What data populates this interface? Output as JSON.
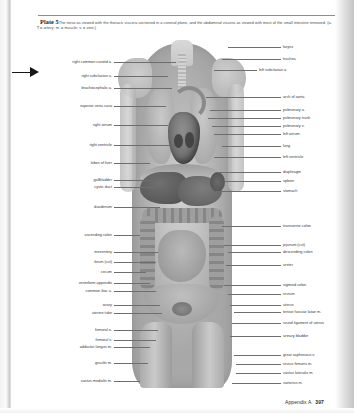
{
  "page": {
    "plate_number": "Plate 5",
    "caption": "The torso as viewed with the thoracic viscera sectioned in a coronal plane, and the abdominal viscera as viewed with most of the small intestine removed. (a. = artery; m. = muscle; v. = vein.)",
    "caption_marker": "¶",
    "footer_section": "Appendix A",
    "footer_page": "397"
  },
  "figure": {
    "alt": "grayscale anatomical illustration of female torso with thoracic and abdominal viscera"
  },
  "labels_left": [
    {
      "text": "right common carotid a.",
      "top": 62,
      "text_right": 112,
      "line_from": 114,
      "line_to": 176,
      "line_y": 62
    },
    {
      "text": "right subclavian a.",
      "top": 76,
      "text_right": 112,
      "line_from": 114,
      "line_to": 168,
      "line_y": 76
    },
    {
      "text": "brachiocephalic a.",
      "top": 88,
      "text_right": 112,
      "line_from": 114,
      "line_to": 172,
      "line_y": 88
    },
    {
      "text": "superior vena cava",
      "top": 106,
      "text_right": 112,
      "line_from": 114,
      "line_to": 166,
      "line_y": 106
    },
    {
      "text": "right atrium",
      "top": 125,
      "text_right": 112,
      "line_from": 114,
      "line_to": 168,
      "line_y": 125
    },
    {
      "text": "right ventricle",
      "top": 145,
      "text_right": 112,
      "line_from": 114,
      "line_to": 170,
      "line_y": 145
    },
    {
      "text": "lobes of liver",
      "top": 163,
      "text_right": 112,
      "line_from": 114,
      "line_to": 150,
      "line_y": 163
    },
    {
      "text": "gallbladder",
      "top": 180,
      "text_right": 112,
      "line_from": 114,
      "line_to": 152,
      "line_y": 180
    },
    {
      "text": "cystic duct",
      "top": 187,
      "text_right": 112,
      "line_from": 114,
      "line_to": 156,
      "line_y": 187
    },
    {
      "text": "duodenum",
      "top": 207,
      "text_right": 112,
      "line_from": 114,
      "line_to": 160,
      "line_y": 207
    },
    {
      "text": "ascending colon",
      "top": 235,
      "text_right": 112,
      "line_from": 114,
      "line_to": 140,
      "line_y": 235
    },
    {
      "text": "mesentery",
      "top": 252,
      "text_right": 112,
      "line_from": 114,
      "line_to": 158,
      "line_y": 252
    },
    {
      "text": "ileum (cut)",
      "top": 262,
      "text_right": 112,
      "line_from": 114,
      "line_to": 156,
      "line_y": 262
    },
    {
      "text": "cecum",
      "top": 272,
      "text_right": 112,
      "line_from": 114,
      "line_to": 146,
      "line_y": 272
    },
    {
      "text": "vermiform appendix",
      "top": 283,
      "text_right": 112,
      "line_from": 114,
      "line_to": 150,
      "line_y": 283
    },
    {
      "text": "common iliac a.",
      "top": 291,
      "text_right": 112,
      "line_from": 114,
      "line_to": 156,
      "line_y": 291
    },
    {
      "text": "ovary",
      "top": 305,
      "text_right": 112,
      "line_from": 114,
      "line_to": 160,
      "line_y": 305
    },
    {
      "text": "uterine tube",
      "top": 313,
      "text_right": 112,
      "line_from": 114,
      "line_to": 162,
      "line_y": 313
    },
    {
      "text": "femoral a.",
      "top": 330,
      "text_right": 112,
      "line_from": 114,
      "line_to": 158,
      "line_y": 330
    },
    {
      "text": "femoral v.",
      "top": 340,
      "text_right": 112,
      "line_from": 114,
      "line_to": 156,
      "line_y": 340
    },
    {
      "text": "adductor longus m.",
      "top": 347,
      "text_right": 112,
      "line_from": 114,
      "line_to": 150,
      "line_y": 347
    },
    {
      "text": "gracilis m.",
      "top": 363,
      "text_right": 112,
      "line_from": 114,
      "line_to": 148,
      "line_y": 363
    },
    {
      "text": "vastus medialis m.",
      "top": 381,
      "text_right": 112,
      "line_from": 114,
      "line_to": 140,
      "line_y": 381
    }
  ],
  "labels_right": [
    {
      "text": "larynx",
      "top": 47,
      "text_left": 283,
      "line_from": 228,
      "line_to": 281,
      "line_y": 47
    },
    {
      "text": "trachea",
      "top": 59,
      "text_left": 283,
      "line_from": 222,
      "line_to": 281,
      "line_y": 59
    },
    {
      "text": "left subclavian a.",
      "top": 70,
      "text_left": 259,
      "line_from": 214,
      "line_to": 257,
      "line_y": 70
    },
    {
      "text": "arch of aorta",
      "top": 97,
      "text_left": 283,
      "line_from": 206,
      "line_to": 281,
      "line_y": 97
    },
    {
      "text": "pulmonary a.",
      "top": 110,
      "text_left": 283,
      "line_from": 210,
      "line_to": 281,
      "line_y": 110
    },
    {
      "text": "pulmonary trunk",
      "top": 118,
      "text_left": 283,
      "line_from": 208,
      "line_to": 281,
      "line_y": 118
    },
    {
      "text": "pulmonary v.",
      "top": 126,
      "text_left": 283,
      "line_from": 212,
      "line_to": 281,
      "line_y": 126
    },
    {
      "text": "left atrium",
      "top": 134,
      "text_left": 283,
      "line_from": 214,
      "line_to": 281,
      "line_y": 134
    },
    {
      "text": "lung",
      "top": 146,
      "text_left": 283,
      "line_from": 222,
      "line_to": 281,
      "line_y": 146
    },
    {
      "text": "left ventricle",
      "top": 157,
      "text_left": 283,
      "line_from": 214,
      "line_to": 281,
      "line_y": 157
    },
    {
      "text": "diaphragm",
      "top": 172,
      "text_left": 283,
      "line_from": 218,
      "line_to": 281,
      "line_y": 172
    },
    {
      "text": "spleen",
      "top": 181,
      "text_left": 283,
      "line_from": 224,
      "line_to": 281,
      "line_y": 181
    },
    {
      "text": "stomach",
      "top": 191,
      "text_left": 283,
      "line_from": 216,
      "line_to": 281,
      "line_y": 191
    },
    {
      "text": "transverse colon",
      "top": 226,
      "text_left": 283,
      "line_from": 222,
      "line_to": 281,
      "line_y": 226
    },
    {
      "text": "jejunum (cut)",
      "top": 245,
      "text_left": 283,
      "line_from": 224,
      "line_to": 281,
      "line_y": 245
    },
    {
      "text": "descending colon",
      "top": 252,
      "text_left": 283,
      "line_from": 228,
      "line_to": 281,
      "line_y": 252
    },
    {
      "text": "ureter",
      "top": 265,
      "text_left": 283,
      "line_from": 226,
      "line_to": 281,
      "line_y": 265
    },
    {
      "text": "sigmoid colon",
      "top": 285,
      "text_left": 283,
      "line_from": 224,
      "line_to": 281,
      "line_y": 285
    },
    {
      "text": "rectum",
      "top": 294,
      "text_left": 283,
      "line_from": 228,
      "line_to": 281,
      "line_y": 294
    },
    {
      "text": "uterus",
      "top": 305,
      "text_left": 283,
      "line_from": 230,
      "line_to": 281,
      "line_y": 305
    },
    {
      "text": "tensor fasciae latae m.",
      "top": 312,
      "text_left": 283,
      "line_from": 234,
      "line_to": 281,
      "line_y": 312
    },
    {
      "text": "round ligament of uterus",
      "top": 323,
      "text_left": 283,
      "line_from": 232,
      "line_to": 281,
      "line_y": 323
    },
    {
      "text": "urinary bladder",
      "top": 336,
      "text_left": 283,
      "line_from": 230,
      "line_to": 281,
      "line_y": 336
    },
    {
      "text": "great saphenous v.",
      "top": 355,
      "text_left": 283,
      "line_from": 234,
      "line_to": 281,
      "line_y": 355
    },
    {
      "text": "rectus femoris m.",
      "top": 364,
      "text_left": 283,
      "line_from": 236,
      "line_to": 281,
      "line_y": 364
    },
    {
      "text": "vastus lateralis m.",
      "top": 373,
      "text_left": 283,
      "line_from": 236,
      "line_to": 281,
      "line_y": 373
    },
    {
      "text": "sartorius m.",
      "top": 383,
      "text_left": 283,
      "line_from": 232,
      "line_to": 281,
      "line_y": 383
    }
  ]
}
